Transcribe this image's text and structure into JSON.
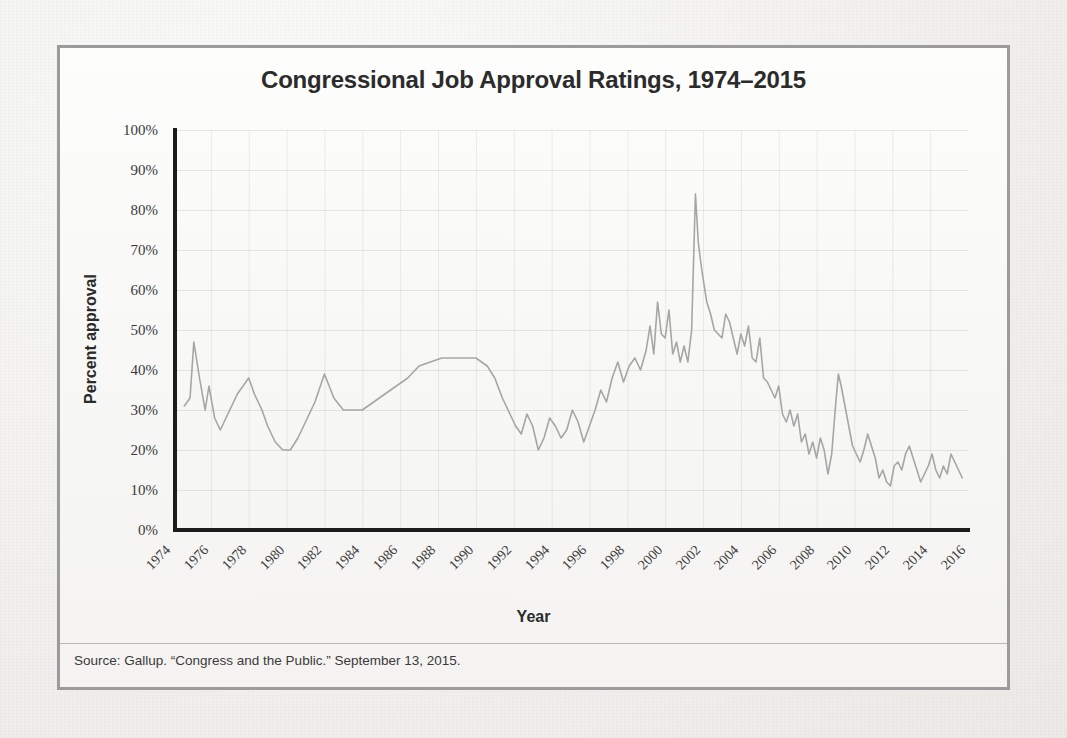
{
  "figure": {
    "title": "Congressional Job Approval Ratings, 1974–2015",
    "x_axis_title": "Year",
    "y_axis_title": "Percent approval",
    "source_note": "Source: Gallup. “Congress and the Public.” September 13, 2015.",
    "border_color": "#9b9b9b",
    "line_color": "#a6a6a6",
    "background_color": "#f6f5f3"
  },
  "chart_data": {
    "type": "line",
    "title": "Congressional Job Approval Ratings, 1974–2015",
    "xlabel": "Year",
    "ylabel": "Percent approval",
    "xlim": [
      1974,
      2016
    ],
    "ylim": [
      0,
      100
    ],
    "grid": true,
    "legend": "none",
    "y_ticklabels": [
      "100%",
      "90%",
      "80%",
      "70%",
      "60%",
      "50%",
      "40%",
      "30%",
      "20%",
      "10%",
      "0%"
    ],
    "y_tickvalues": [
      100,
      90,
      80,
      70,
      60,
      50,
      40,
      30,
      20,
      10,
      0
    ],
    "x_ticklabels": [
      "1974",
      "1976",
      "1978",
      "1980",
      "1982",
      "1984",
      "1986",
      "1988",
      "1990",
      "1992",
      "1994",
      "1996",
      "1998",
      "2000",
      "2002",
      "2004",
      "2006",
      "2008",
      "2010",
      "2012",
      "2014",
      "2016"
    ],
    "x_tickvalues": [
      1974,
      1976,
      1978,
      1980,
      1982,
      1984,
      1986,
      1988,
      1990,
      1992,
      1994,
      1996,
      1998,
      2000,
      2002,
      2004,
      2006,
      2008,
      2010,
      2012,
      2014,
      2016
    ],
    "units": "percent",
    "series": [
      {
        "name": "Congressional job approval",
        "x": [
          1974.6,
          1974.9,
          1975.1,
          1975.4,
          1975.7,
          1975.9,
          1976.2,
          1976.5,
          1976.8,
          1977.1,
          1977.4,
          1977.7,
          1978.0,
          1978.3,
          1978.7,
          1979.0,
          1979.4,
          1979.8,
          1980.2,
          1980.6,
          1981.0,
          1981.5,
          1982.0,
          1982.5,
          1983.0,
          1983.5,
          1984.0,
          1984.6,
          1985.2,
          1985.8,
          1986.4,
          1987.0,
          1987.6,
          1988.2,
          1988.8,
          1989.4,
          1990.0,
          1990.6,
          1991.0,
          1991.4,
          1991.8,
          1992.1,
          1992.4,
          1992.7,
          1993.0,
          1993.3,
          1993.6,
          1993.9,
          1994.2,
          1994.5,
          1994.8,
          1995.1,
          1995.4,
          1995.7,
          1996.0,
          1996.3,
          1996.6,
          1996.9,
          1997.2,
          1997.5,
          1997.8,
          1998.1,
          1998.4,
          1998.7,
          1999.0,
          1999.2,
          1999.4,
          1999.6,
          1999.8,
          2000.0,
          2000.2,
          2000.4,
          2000.6,
          2000.8,
          2001.0,
          2001.2,
          2001.4,
          2001.6,
          2001.75,
          2001.85,
          2002.0,
          2002.2,
          2002.4,
          2002.6,
          2002.8,
          2003.0,
          2003.2,
          2003.4,
          2003.6,
          2003.8,
          2004.0,
          2004.2,
          2004.4,
          2004.6,
          2004.8,
          2005.0,
          2005.2,
          2005.4,
          2005.6,
          2005.8,
          2006.0,
          2006.2,
          2006.4,
          2006.6,
          2006.8,
          2007.0,
          2007.2,
          2007.4,
          2007.6,
          2007.8,
          2008.0,
          2008.2,
          2008.4,
          2008.6,
          2008.8,
          2009.0,
          2009.15,
          2009.3,
          2009.5,
          2009.7,
          2009.9,
          2010.1,
          2010.3,
          2010.5,
          2010.7,
          2010.9,
          2011.1,
          2011.3,
          2011.5,
          2011.7,
          2011.9,
          2012.1,
          2012.3,
          2012.5,
          2012.7,
          2012.9,
          2013.1,
          2013.3,
          2013.5,
          2013.7,
          2013.9,
          2014.1,
          2014.3,
          2014.5,
          2014.7,
          2014.9,
          2015.1,
          2015.3,
          2015.5,
          2015.7
        ],
        "y": [
          31,
          33,
          47,
          38,
          30,
          36,
          28,
          25,
          28,
          31,
          34,
          36,
          38,
          34,
          30,
          26,
          22,
          20,
          20,
          23,
          27,
          32,
          39,
          33,
          30,
          30,
          30,
          32,
          34,
          36,
          38,
          41,
          42,
          43,
          43,
          43,
          43,
          41,
          38,
          33,
          29,
          26,
          24,
          29,
          26,
          20,
          23,
          28,
          26,
          23,
          25,
          30,
          27,
          22,
          26,
          30,
          35,
          32,
          38,
          42,
          37,
          41,
          43,
          40,
          45,
          51,
          44,
          57,
          49,
          48,
          55,
          44,
          47,
          42,
          46,
          42,
          50,
          84,
          72,
          68,
          63,
          57,
          54,
          50,
          49,
          48,
          54,
          52,
          48,
          44,
          49,
          46,
          51,
          43,
          42,
          48,
          38,
          37,
          35,
          33,
          36,
          29,
          27,
          30,
          26,
          29,
          22,
          24,
          19,
          22,
          18,
          23,
          20,
          14,
          19,
          31,
          39,
          36,
          31,
          26,
          21,
          19,
          17,
          20,
          24,
          21,
          18,
          13,
          15,
          12,
          11,
          16,
          17,
          15,
          19,
          21,
          18,
          15,
          12,
          14,
          16,
          19,
          15,
          13,
          16,
          14,
          19,
          17,
          15,
          13
        ],
        "notable_points": [
          {
            "year": 2001.6,
            "value": 84,
            "note": "Post-9/11 peak"
          },
          {
            "year": 1979.8,
            "value": 20,
            "note": "Late-1970s low"
          },
          {
            "year": 2013.5,
            "value": 12,
            "note": "Record low"
          }
        ]
      }
    ]
  }
}
